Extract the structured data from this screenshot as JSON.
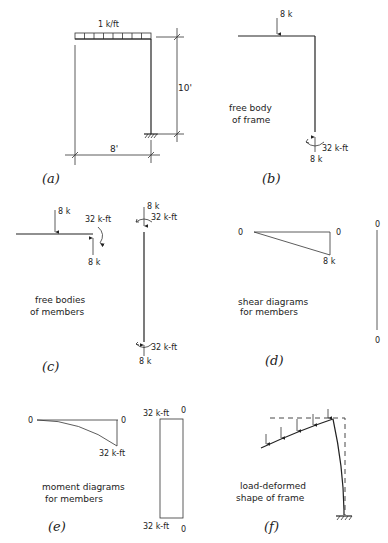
{
  "figure": {
    "panels": {
      "a": {
        "tag": "(a)",
        "load_label": "1 k/ft",
        "height_label": "10'",
        "span_label": "8'"
      },
      "b": {
        "tag": "(b)",
        "caption_line1": "free body",
        "caption_line2": "of frame",
        "top_load": "8 k",
        "base_moment": "32 k-ft",
        "base_reaction": "8 k"
      },
      "c": {
        "tag": "(c)",
        "caption_line1": "free bodies",
        "caption_line2": "of members",
        "beam_load": "8 k",
        "beam_moment": "32 k-ft",
        "beam_reaction": "8 k",
        "col_top_force": "8 k",
        "col_top_moment": "32 k-ft",
        "col_bottom_moment": "32 k-ft",
        "col_bottom_force": "8 k"
      },
      "d": {
        "tag": "(d)",
        "caption_line1": "shear diagrams",
        "caption_line2": "for members",
        "beam_left": "0",
        "beam_right": "0",
        "beam_max": "8 k",
        "col_top": "0",
        "col_bottom": "0"
      },
      "e": {
        "tag": "(e)",
        "caption_line1": "moment diagrams",
        "caption_line2": "for members",
        "beam_left": "0",
        "beam_right": "0",
        "beam_max": "32 k-ft",
        "col_top_value": "32 k-ft",
        "col_top_zero": "0",
        "col_bottom_value": "32 k-ft",
        "col_bottom_zero": "0"
      },
      "f": {
        "tag": "(f)",
        "caption_line1": "load-deformed",
        "caption_line2": "shape of frame"
      }
    }
  }
}
